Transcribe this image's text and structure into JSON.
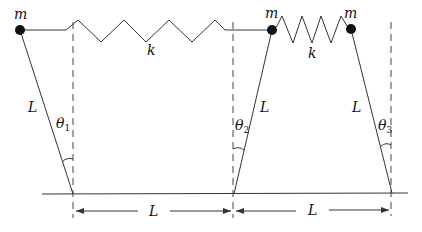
{
  "diagram": {
    "masses": [
      {
        "label": "m",
        "x": 20,
        "y": 30
      },
      {
        "label": "m",
        "x": 272,
        "y": 30
      },
      {
        "label": "m",
        "x": 351,
        "y": 29
      }
    ],
    "springs": [
      {
        "label": "k",
        "between": [
          1,
          2
        ]
      },
      {
        "label": "k",
        "between": [
          2,
          3
        ]
      }
    ],
    "rods": [
      {
        "length_label": "L",
        "angle_label": "θ",
        "angle_sub": "1"
      },
      {
        "length_label": "L",
        "angle_label": "θ",
        "angle_sub": "2"
      },
      {
        "length_label": "L",
        "angle_label": "θ",
        "angle_sub": "3"
      }
    ],
    "dimensions": [
      {
        "label": "L",
        "from": "pivot 1",
        "to": "pivot 2"
      },
      {
        "label": "L",
        "from": "pivot 2",
        "to": "pivot 3"
      }
    ],
    "colors": {
      "ink": "#333333",
      "mass": "#111111",
      "background": "#ffffff"
    }
  }
}
